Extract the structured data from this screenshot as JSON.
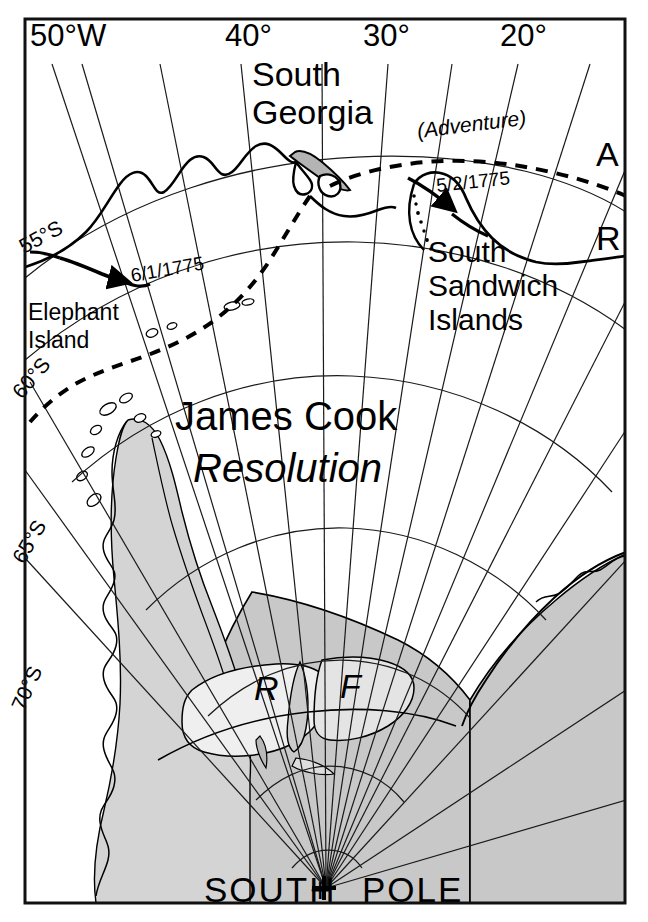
{
  "figure": {
    "kind": "historical-expedition-map",
    "border_color": "#111111",
    "background_color": "#ffffff",
    "land_fill": "#c8c8c8",
    "shelf_fill": "#e8e8e8",
    "graticule_color": "#1a1a1a",
    "coast_color": "#000000"
  },
  "longitude_labels": [
    {
      "text": "50°W",
      "x": 30,
      "y": 46
    },
    {
      "text": "40°",
      "x": 225,
      "y": 46
    },
    {
      "text": "30°",
      "x": 363,
      "y": 46
    },
    {
      "text": "20°",
      "x": 500,
      "y": 46
    }
  ],
  "latitude_labels": [
    {
      "text": "55°S",
      "x": 24,
      "y": 254,
      "rotation": -28
    },
    {
      "text": "60°S",
      "x": 22,
      "y": 400,
      "rotation": -50
    },
    {
      "text": "65°S",
      "x": 24,
      "y": 565,
      "rotation": -60
    },
    {
      "text": "70°S",
      "x": 24,
      "y": 712,
      "rotation": -66
    }
  ],
  "place_labels": [
    {
      "name": "south-georgia",
      "lines": [
        "South",
        "Georgia"
      ],
      "x": 252,
      "y": 86
    },
    {
      "name": "south-sandwich-islands",
      "lines": [
        "South",
        "Sandwich",
        "Islands"
      ],
      "x": 428,
      "y": 262
    },
    {
      "name": "elephant-island",
      "lines": [
        "Elephant",
        "Island"
      ],
      "x": 28,
      "y": 320
    }
  ],
  "expedition": {
    "commander": "James Cook",
    "commander_x": 175,
    "commander_y": 430,
    "ship_primary": "Resolution",
    "ship_primary_x": 193,
    "ship_primary_y": 482,
    "ship_secondary": "(Adventure)",
    "ship_secondary_x": 418,
    "ship_secondary_y": 138,
    "track_letters": [
      {
        "text": "A",
        "x": 596,
        "y": 166,
        "meaning": "adventure-track"
      },
      {
        "text": "R",
        "x": 596,
        "y": 250,
        "meaning": "resolution-track"
      }
    ],
    "dates": [
      {
        "text": "6/1/1775",
        "x": 132,
        "y": 282,
        "rotation": -10
      },
      {
        "text": "5/2/1775",
        "x": 437,
        "y": 192,
        "rotation": -6
      }
    ]
  },
  "ice_shelf_letters": [
    {
      "text": "R",
      "x": 254,
      "y": 700,
      "meaning": "ronne-ice-shelf"
    },
    {
      "text": "F",
      "x": 340,
      "y": 698,
      "meaning": "filchner-ice-shelf"
    }
  ],
  "pole": {
    "label_left": "SOUTH",
    "label_marker": "+",
    "label_right": "POLE",
    "label_y": 902,
    "marker_x": 324,
    "marker_y": 888
  }
}
